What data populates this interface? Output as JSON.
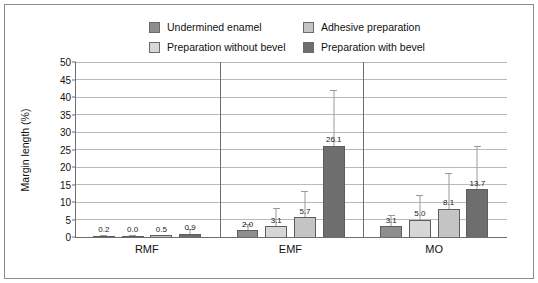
{
  "chart_data": {
    "type": "bar",
    "title": "",
    "xlabel": "",
    "ylabel": "Margin length (%)",
    "ylim": [
      0,
      50
    ],
    "ytick_step": 5,
    "yticks": [
      0,
      5,
      10,
      15,
      20,
      25,
      30,
      35,
      40,
      45,
      50
    ],
    "grid": true,
    "legend_position": "top",
    "categories": [
      "RMF",
      "EMF",
      "MO"
    ],
    "series": [
      {
        "name": "Undermined enamel",
        "color": "#8e8e8e",
        "values": [
          0.2,
          2.0,
          3.1
        ],
        "labels": [
          "0.2",
          "2.0",
          "3.1"
        ],
        "error_high": [
          0.5,
          3.6,
          6.2
        ]
      },
      {
        "name": "Preparation without bevel",
        "color": "#d6d6d6",
        "values": [
          0.0,
          3.1,
          5.0
        ],
        "labels": [
          "0.0",
          "3.1",
          "5.0"
        ],
        "error_high": [
          0.6,
          8.3,
          12.1
        ]
      },
      {
        "name": "Adhesive preparation",
        "color": "#c4c4c4",
        "values": [
          0.5,
          5.7,
          8.1
        ],
        "labels": [
          "0.5",
          "5.7",
          "8.1"
        ],
        "error_high": [
          0.5,
          13.1,
          18.3
        ]
      },
      {
        "name": "Preparation with bevel",
        "color": "#6e6e6e",
        "values": [
          0.9,
          26.1,
          13.7
        ],
        "labels": [
          "0.9",
          "26.1",
          "13.7"
        ],
        "error_high": [
          2.2,
          42.1,
          26.0
        ]
      }
    ]
  },
  "legend": {
    "items": [
      {
        "label": "Undermined enamel",
        "color": "#8e8e8e"
      },
      {
        "label": "Adhesive preparation",
        "color": "#c4c4c4"
      },
      {
        "label": "Preparation without bevel",
        "color": "#d6d6d6"
      },
      {
        "label": "Preparation with bevel",
        "color": "#6e6e6e"
      }
    ]
  },
  "axes": {
    "y_title": "Margin length (%)"
  },
  "colors": {
    "frame": "#8b8b8b",
    "axis": "#6e6e6e",
    "grid": "#b9b9b9",
    "error_bar": "#9a9a9a",
    "background": "#ffffff"
  }
}
